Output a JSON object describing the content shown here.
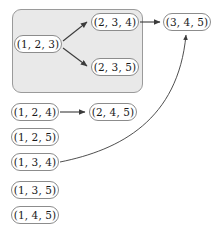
{
  "diagram": {
    "colors": {
      "group_fill": "#e9e9e9",
      "group_border": "#9a9a9a",
      "node_fill": "#ffffff",
      "node_border": "#8c8c8c",
      "edge": "#3b3b3b",
      "text": "#1a1a1a",
      "background": "#ffffff"
    },
    "group": {
      "name": "grouped-cluster",
      "x": 12,
      "y": 9,
      "width": 131,
      "height": 84
    },
    "nodes": [
      {
        "id": "n123",
        "label": "(1, 2, 3)",
        "x": 14,
        "y": 35,
        "width": 48,
        "height": 18,
        "in_group": true
      },
      {
        "id": "n234",
        "label": "(2, 3, 4)",
        "x": 91,
        "y": 13,
        "width": 48,
        "height": 18,
        "in_group": true
      },
      {
        "id": "n235",
        "label": "(2, 3, 5)",
        "x": 91,
        "y": 58,
        "width": 48,
        "height": 18,
        "in_group": true
      },
      {
        "id": "n345",
        "label": "(3, 4, 5)",
        "x": 163,
        "y": 13,
        "width": 48,
        "height": 18,
        "in_group": false
      },
      {
        "id": "n124",
        "label": "(1, 2, 4)",
        "x": 11,
        "y": 103,
        "width": 48,
        "height": 18,
        "in_group": false
      },
      {
        "id": "n245",
        "label": "(2, 4, 5)",
        "x": 89,
        "y": 103,
        "width": 48,
        "height": 18,
        "in_group": false
      },
      {
        "id": "n125",
        "label": "(1, 2, 5)",
        "x": 11,
        "y": 128,
        "width": 48,
        "height": 18,
        "in_group": false
      },
      {
        "id": "n134",
        "label": "(1, 3, 4)",
        "x": 11,
        "y": 153,
        "width": 48,
        "height": 18,
        "in_group": false
      },
      {
        "id": "n135",
        "label": "(1, 3, 5)",
        "x": 11,
        "y": 181,
        "width": 48,
        "height": 18,
        "in_group": false
      },
      {
        "id": "n145",
        "label": "(1, 4, 5)",
        "x": 11,
        "y": 206,
        "width": 48,
        "height": 18,
        "in_group": false
      }
    ],
    "edges": [
      {
        "id": "e1",
        "from": "n123",
        "to": "n234",
        "kind": "straight",
        "path": "M 63 41 L 87 22"
      },
      {
        "id": "e2",
        "from": "n123",
        "to": "n235",
        "kind": "straight",
        "path": "M 63 48 L 87 66"
      },
      {
        "id": "e3",
        "from": "n234",
        "to": "n345",
        "kind": "straight",
        "path": "M 140 22 L 160 22"
      },
      {
        "id": "e4",
        "from": "n124",
        "to": "n245",
        "kind": "straight",
        "path": "M 60 112 L 85 112"
      },
      {
        "id": "e5",
        "from": "n134",
        "to": "n345",
        "kind": "curved",
        "path": "M 60 162 C 120 150 178 120 186 35"
      }
    ]
  }
}
